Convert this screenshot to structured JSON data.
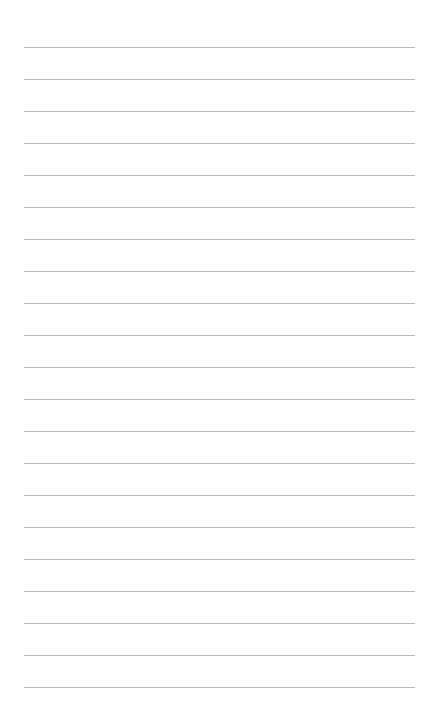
{
  "page": {
    "type": "blank-lined-sheet",
    "background_color": "#ffffff",
    "rule_color": "#b9b9b9",
    "rule_count": 21,
    "rule_start_y": 47,
    "rule_spacing": 32,
    "rule_left": 24,
    "rule_width": 391
  }
}
